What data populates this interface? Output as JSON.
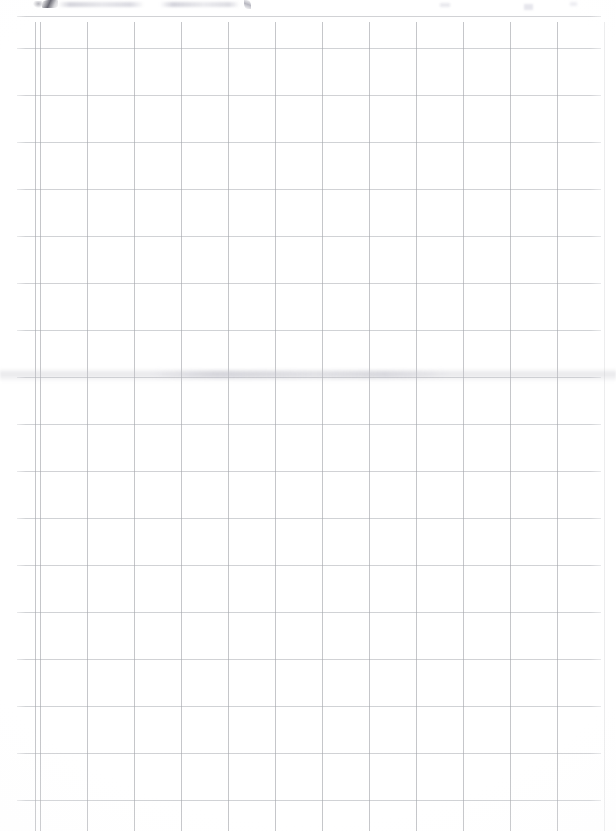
{
  "document": {
    "kind": "scanned-grid-paper",
    "title": "Graph paper scan",
    "page_width": 616,
    "page_height": 831,
    "background_color": "#ffffff",
    "content_text": ""
  },
  "grid": {
    "cell_size_px": 23.5,
    "vertical_line_color": "#96989e",
    "horizontal_line_color": "#a3a6ac",
    "vertical_line_count": 25,
    "horizontal_line_count": 33,
    "first_vertical_line_x": 40,
    "first_horizontal_line_y": 48,
    "grid_top": 22,
    "grid_left": 17,
    "grid_right": 601,
    "grid_bottom": 831
  },
  "artifacts": {
    "top_marks": {
      "label": "faint cropped handwriting at top edge",
      "y": 0,
      "height": 16,
      "ink_color": "#46464f"
    },
    "smudge_band": {
      "label": "faint horizontal smudge across sheet",
      "y": 368,
      "height": 14,
      "color": "#c6c6cd"
    }
  }
}
